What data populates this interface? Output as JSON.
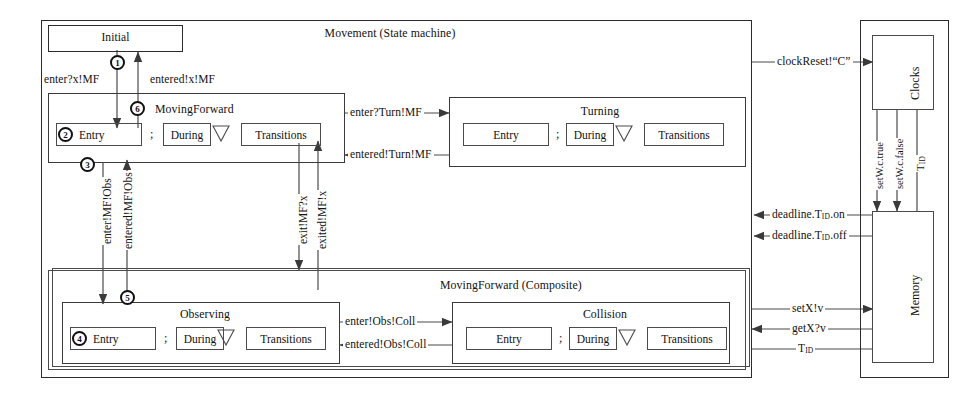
{
  "diagram": {
    "outer_title": "Movement (State machine)",
    "composite_title": "MovingForward (Composite)"
  },
  "states": {
    "initial": {
      "name": "Initial"
    },
    "moving_forward": {
      "title": "MovingForward",
      "entry": "Entry",
      "during": "During",
      "transitions": "Transitions",
      "sep": ";",
      "marker": "2"
    },
    "turning": {
      "title": "Turning",
      "entry": "Entry",
      "during": "During",
      "transitions": "Transitions",
      "sep": ";"
    },
    "observing": {
      "title": "Observing",
      "entry": "Entry",
      "during": "During",
      "transitions": "Transitions",
      "sep": ";",
      "marker": "4"
    },
    "collision": {
      "title": "Collision",
      "entry": "Entry",
      "during": "During",
      "transitions": "Transitions",
      "sep": ";"
    }
  },
  "markers": {
    "m1": "1",
    "m2": "2",
    "m3": "3",
    "m4": "4",
    "m5": "5",
    "m6": "6"
  },
  "edges": {
    "enter_x_mf": "enter?x!MF",
    "entered_x_mf": "entered!x!MF",
    "enter_turn_mf": "enter?Turn!MF",
    "entered_turn_mf": "entered!Turn!MF",
    "enter_mf_obs": "enter!MF!Obs",
    "entered_mf_obs": "entered!MF!Obs",
    "exit_mf_x": "exit!MF?x",
    "exited_mf_x": "exited!MF!x",
    "enter_obs_coll": "enter!Obs!Coll",
    "entered_obs_coll": "entered!Obs!Coll"
  },
  "hardware": {
    "clocks": "Clocks",
    "memory": "Memory",
    "clock_reset": "clockReset!“C”",
    "set_w_true": "setW.c.true",
    "set_w_false": "setW.c.false",
    "t_id_clock": "T",
    "t_id_sub": "ID",
    "deadline_on_pre": "deadline.T",
    "deadline_on_post": ".on",
    "deadline_off_pre": "deadline.T",
    "deadline_off_post": ".off",
    "set_x": "setX!v",
    "get_x": "getX?v",
    "t_id_mem": "T"
  },
  "colors": {
    "line": "#2b2b2b",
    "text": "#111111",
    "background": "#ffffff"
  }
}
